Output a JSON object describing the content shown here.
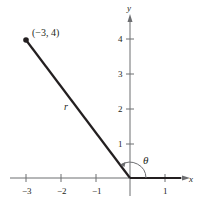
{
  "diagram": {
    "type": "coordinate-plane-angle",
    "axes": {
      "x_label": "x",
      "y_label": "y",
      "x_ticks": [
        {
          "value": -3,
          "label": "−3"
        },
        {
          "value": -2,
          "label": "−2"
        },
        {
          "value": -1,
          "label": "−1"
        },
        {
          "value": 1,
          "label": "1"
        }
      ],
      "y_ticks": [
        {
          "value": 1,
          "label": "1"
        },
        {
          "value": 2,
          "label": "2"
        },
        {
          "value": 3,
          "label": "3"
        },
        {
          "value": 4,
          "label": "4"
        }
      ]
    },
    "point": {
      "x": -3,
      "y": 4,
      "label": "(−3, 4)"
    },
    "segment_label": "r",
    "angle_label": "θ",
    "colors": {
      "ink": "#231f20",
      "axis": "#6d6e71"
    }
  }
}
